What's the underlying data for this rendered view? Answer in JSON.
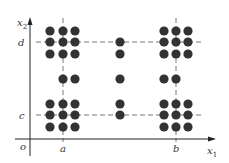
{
  "diagram": {
    "colors": {
      "dot": "#333333",
      "axis": "#222222",
      "dash": "#555555"
    },
    "axes": {
      "origin_label": "o",
      "x_label": "x",
      "x_sub": "1",
      "y_label": "x",
      "y_sub": "2"
    },
    "ticks": {
      "a": "a",
      "b": "b",
      "c": "c",
      "d": "d"
    },
    "dots": [
      [
        50,
        31
      ],
      [
        63,
        31
      ],
      [
        75,
        31
      ],
      [
        50,
        42
      ],
      [
        63,
        42
      ],
      [
        75,
        42
      ],
      [
        50,
        54
      ],
      [
        63,
        54
      ],
      [
        75,
        54
      ],
      [
        164,
        31
      ],
      [
        176,
        31
      ],
      [
        188,
        31
      ],
      [
        164,
        42
      ],
      [
        176,
        42
      ],
      [
        188,
        42
      ],
      [
        164,
        54
      ],
      [
        176,
        54
      ],
      [
        188,
        54
      ],
      [
        50,
        104
      ],
      [
        63,
        104
      ],
      [
        75,
        104
      ],
      [
        50,
        115
      ],
      [
        63,
        115
      ],
      [
        75,
        115
      ],
      [
        50,
        127
      ],
      [
        63,
        127
      ],
      [
        75,
        127
      ],
      [
        164,
        104
      ],
      [
        176,
        104
      ],
      [
        188,
        104
      ],
      [
        164,
        115
      ],
      [
        176,
        115
      ],
      [
        188,
        115
      ],
      [
        164,
        127
      ],
      [
        176,
        127
      ],
      [
        188,
        127
      ],
      [
        63,
        79
      ],
      [
        75,
        79
      ],
      [
        120,
        79
      ],
      [
        164,
        79
      ],
      [
        176,
        79
      ],
      [
        120,
        42
      ],
      [
        120,
        54
      ],
      [
        120,
        104
      ],
      [
        120,
        115
      ]
    ]
  }
}
